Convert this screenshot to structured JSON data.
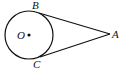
{
  "diagram": {
    "type": "geometry",
    "circle": {
      "center_label": "O",
      "cx": 29,
      "cy": 35,
      "r": 24
    },
    "points": [
      {
        "label": "B",
        "x": 39,
        "y": 13
      },
      {
        "label": "C",
        "x": 40,
        "y": 57
      },
      {
        "label": "A",
        "x": 110,
        "y": 34
      },
      {
        "label": "O",
        "x": 29,
        "y": 35
      }
    ],
    "segments": [
      {
        "from": "A",
        "to": "B"
      },
      {
        "from": "A",
        "to": "C"
      }
    ],
    "labels": {
      "B": "B",
      "C": "C",
      "A": "A",
      "O": "O"
    },
    "stroke_color": "#111111"
  }
}
